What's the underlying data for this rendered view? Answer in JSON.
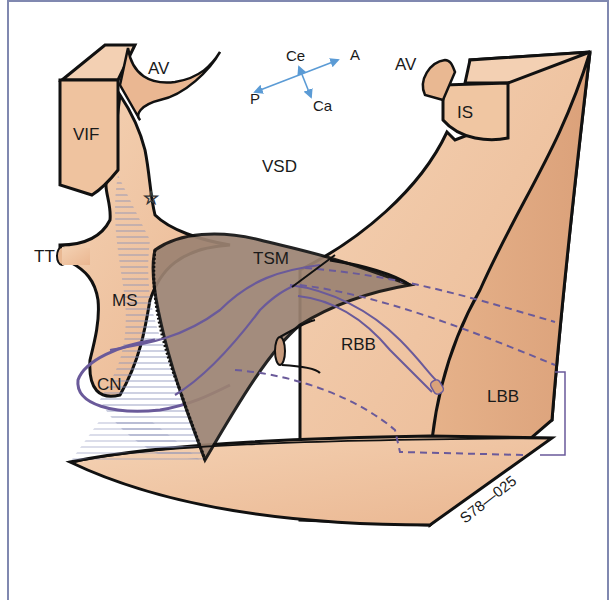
{
  "diagram": {
    "labels": {
      "av_left": "AV",
      "av_right": "AV",
      "vif": "VIF",
      "is": "IS",
      "vsd": "VSD",
      "tt": "TT",
      "ms": "MS",
      "tsm": "TSM",
      "cn": "CN",
      "rbb": "RBB",
      "lbb": "LBB",
      "figure_code": "S78—025"
    },
    "orientation": {
      "ce": "Ce",
      "a": "A",
      "p": "P",
      "ca": "Ca"
    },
    "marker": {
      "star": "☆"
    },
    "colors": {
      "tissue": "#f1c7a4",
      "tissue_dark": "#e0a87e",
      "septal_band": "#9c8372",
      "conduction": "#6a5a9a",
      "orientation_arrows": "#5b9bd5",
      "outline": "#111111",
      "frame": "#8088b0"
    }
  }
}
